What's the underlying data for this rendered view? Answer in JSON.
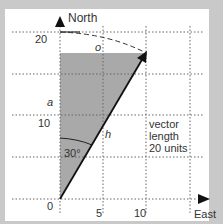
{
  "diagram": {
    "axes": {
      "y_label": "North",
      "x_label": "East",
      "y_ticks": [
        "20",
        "10",
        "0"
      ],
      "x_ticks": [
        "5",
        "10"
      ]
    },
    "labels": {
      "opposite": "o",
      "adjacent": "a",
      "hypotenuse": "h",
      "angle": "30°",
      "vector_line1": "vector",
      "vector_line2": "length",
      "vector_line3": "20 units"
    },
    "vector": {
      "length": 20,
      "angle_from_north_deg": 30,
      "east_component": 10,
      "north_component": 17.3
    },
    "colors": {
      "shade": "#a9a9a9",
      "background": "#c9c9c9",
      "panel": "#ffffff",
      "line": "#222222",
      "grid": "#666666"
    }
  }
}
